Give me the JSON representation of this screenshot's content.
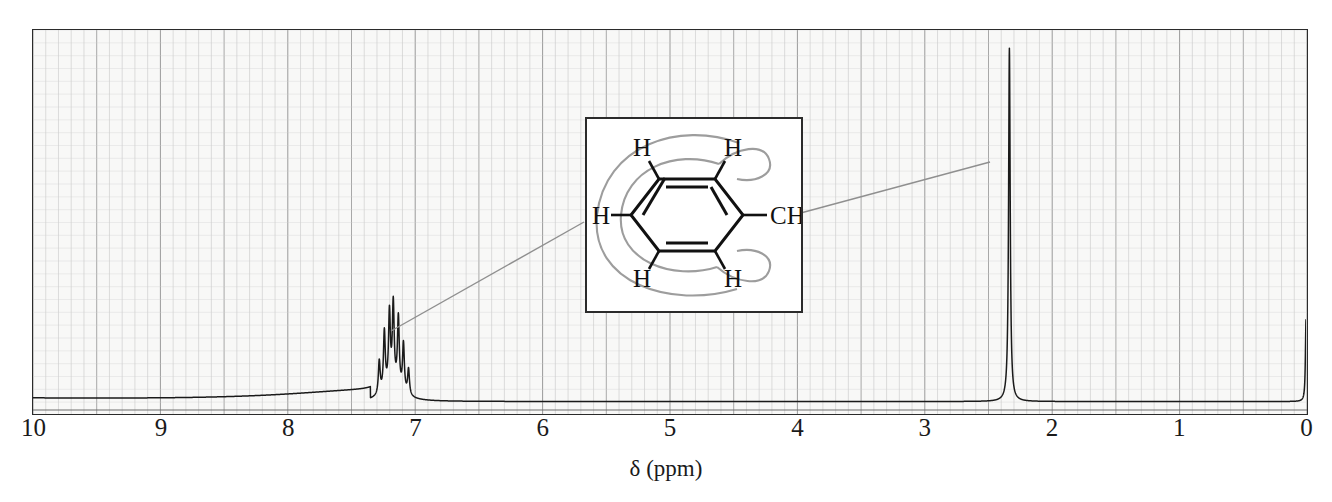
{
  "figure": {
    "kind": "nmr-spectrum",
    "compound": "toluene"
  },
  "axis": {
    "title": "δ (ppm)",
    "tick_labels": [
      "10",
      "9",
      "8",
      "7",
      "6",
      "5",
      "4",
      "3",
      "2",
      "1",
      "0"
    ],
    "tick_values": [
      10,
      9,
      8,
      7,
      6,
      5,
      4,
      3,
      2,
      1,
      0
    ]
  },
  "inset": {
    "labels": {
      "h_top_left": "H",
      "h_top_right": "H",
      "h_left": "H",
      "h_bottom_left": "H",
      "h_bottom_right": "H",
      "methyl": "CH",
      "methyl_sub": "3"
    }
  },
  "colors": {
    "trace": "#1a1a1a",
    "frame": "#2b2b2b",
    "grid_minor": "#cfcfcf",
    "grid_major": "#9a9a9a",
    "paper": "#f4f4f2",
    "leader": "#8a8a8a",
    "ring_current": "#9a9a9a",
    "bond": "#111111"
  },
  "chart_data": {
    "type": "line",
    "title": "",
    "xlabel": "δ (ppm)",
    "ylabel": "",
    "xlim": [
      10,
      0
    ],
    "xaxis_reversed": true,
    "grid": true,
    "grid_minor_step": 0.1,
    "grid_major_step": 0.5,
    "peaks": [
      {
        "assignment": "aromatic H (C6H5)",
        "shift_ppm": 7.17,
        "multiplicity": "multiplet",
        "relative_height": 0.22,
        "integration_h": 5,
        "range_ppm": [
          7.02,
          7.32
        ],
        "lines_ppm": [
          7.28,
          7.24,
          7.2,
          7.17,
          7.13,
          7.09,
          7.05
        ],
        "line_heights": [
          0.09,
          0.16,
          0.2,
          0.22,
          0.19,
          0.13,
          0.07
        ]
      },
      {
        "assignment": "CH3",
        "shift_ppm": 2.33,
        "multiplicity": "singlet",
        "relative_height": 0.95,
        "integration_h": 3
      },
      {
        "assignment": "TMS reference",
        "shift_ppm": 0.0,
        "multiplicity": "singlet",
        "relative_height": 0.22,
        "integration_h": 0
      }
    ],
    "baseline": {
      "left_ppm": 10.0,
      "left_level": 0.025,
      "rise_start_ppm": 9.0,
      "right_level": 0.012,
      "note": "slow rising hump from 10 ppm toward the aromatic region, flat baseline below 7 ppm"
    }
  }
}
